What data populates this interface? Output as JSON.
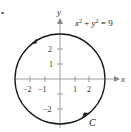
{
  "figure": {
    "bullet": "•",
    "equation": {
      "lhs_x": "x",
      "exp_x": "2",
      "plus": " + ",
      "lhs_y": "y",
      "exp_y": "2",
      "rhs": " = 9"
    },
    "curve_label": "C",
    "orientation": "counterclockwise",
    "circle": {
      "center": [
        0,
        0
      ],
      "radius": 3
    },
    "axes": {
      "x_label": "x",
      "y_label": "y",
      "x_ticks": [
        {
          "value": -2,
          "label": "−2"
        },
        {
          "value": -1,
          "label": "−1"
        },
        {
          "value": 1,
          "label": "1"
        },
        {
          "value": 2,
          "label": "2"
        }
      ],
      "y_ticks": [
        {
          "value": 2,
          "label": "2"
        },
        {
          "value": 1,
          "label": "1"
        },
        {
          "value": -1,
          "label": ""
        },
        {
          "value": -2,
          "label": "−2"
        }
      ]
    },
    "colors": {
      "stroke": "#1a1a1a",
      "axis": "#888888",
      "text": "#333333"
    }
  }
}
